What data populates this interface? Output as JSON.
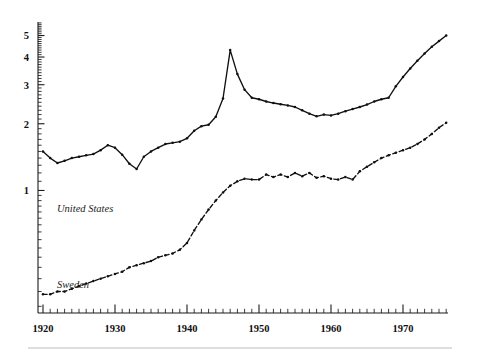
{
  "chart": {
    "title": "",
    "subtitle": "",
    "xlabel": "",
    "ylabel": ""
  },
  "axes": {
    "x_tick_labels": [
      "1920",
      "1930",
      "1940",
      "1950",
      "1960",
      "1970"
    ],
    "y_tick_labels": [
      "1",
      "2",
      "3",
      "4",
      "5"
    ],
    "x_range": [
      1919,
      1977
    ],
    "y_range": [
      0.28,
      6.0
    ],
    "y_scale": "log",
    "grid": false
  },
  "series_labels": {
    "united_states": "United States",
    "sweden": "Sweden"
  },
  "colors": {
    "ink": "#101010",
    "background": "#ffffff",
    "rule": "#d3d3d3"
  },
  "chart_data": {
    "type": "line",
    "title": "",
    "xlabel": "",
    "ylabel": "",
    "xlim": [
      1919,
      1977
    ],
    "ylim": [
      0.28,
      6.0
    ],
    "yscale": "log",
    "grid": false,
    "legend": "inline-labels",
    "x": [
      1920,
      1921,
      1922,
      1923,
      1924,
      1925,
      1926,
      1927,
      1928,
      1929,
      1930,
      1931,
      1932,
      1933,
      1934,
      1935,
      1936,
      1937,
      1938,
      1939,
      1940,
      1941,
      1942,
      1943,
      1944,
      1945,
      1946,
      1947,
      1948,
      1949,
      1950,
      1951,
      1952,
      1953,
      1954,
      1955,
      1956,
      1957,
      1958,
      1959,
      1960,
      1961,
      1962,
      1963,
      1964,
      1965,
      1966,
      1967,
      1968,
      1969,
      1970,
      1971,
      1972,
      1973,
      1974,
      1975,
      1976
    ],
    "series": [
      {
        "name": "United States",
        "linestyle": "solid",
        "marker": "dot",
        "values": [
          1.5,
          1.4,
          1.33,
          1.36,
          1.4,
          1.42,
          1.44,
          1.46,
          1.52,
          1.6,
          1.56,
          1.45,
          1.32,
          1.25,
          1.42,
          1.5,
          1.56,
          1.62,
          1.64,
          1.66,
          1.72,
          1.86,
          1.95,
          1.98,
          2.15,
          2.6,
          4.3,
          3.35,
          2.85,
          2.62,
          2.58,
          2.52,
          2.48,
          2.45,
          2.42,
          2.38,
          2.3,
          2.22,
          2.16,
          2.2,
          2.18,
          2.22,
          2.28,
          2.33,
          2.38,
          2.44,
          2.52,
          2.58,
          2.62,
          2.95,
          3.25,
          3.55,
          3.85,
          4.15,
          4.45,
          4.72,
          5.0
        ]
      },
      {
        "name": "Sweden",
        "linestyle": "dashed",
        "marker": "dot",
        "values": [
          0.34,
          0.34,
          0.35,
          0.35,
          0.36,
          0.37,
          0.38,
          0.39,
          0.4,
          0.41,
          0.42,
          0.43,
          0.45,
          0.46,
          0.47,
          0.48,
          0.5,
          0.51,
          0.52,
          0.54,
          0.58,
          0.66,
          0.74,
          0.82,
          0.9,
          0.98,
          1.05,
          1.1,
          1.13,
          1.12,
          1.12,
          1.18,
          1.15,
          1.18,
          1.15,
          1.2,
          1.16,
          1.2,
          1.14,
          1.16,
          1.13,
          1.12,
          1.15,
          1.12,
          1.22,
          1.28,
          1.34,
          1.4,
          1.44,
          1.48,
          1.52,
          1.56,
          1.62,
          1.7,
          1.8,
          1.92,
          2.02
        ]
      }
    ]
  }
}
